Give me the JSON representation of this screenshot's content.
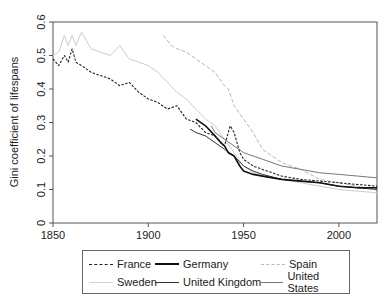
{
  "chart_data": {
    "type": "line",
    "title": "",
    "xlabel": "",
    "ylabel": "Gini coefficient of lifespans",
    "xlim": [
      1850,
      2020
    ],
    "ylim": [
      0,
      0.6
    ],
    "x_ticks": [
      "1850",
      "1900",
      "1950",
      "2000"
    ],
    "y_ticks": [
      "0",
      "0.1",
      "0.2",
      "0.3",
      "0.4",
      "0.5",
      "0.6"
    ],
    "grid": false,
    "legend_position": "bottom",
    "series": [
      {
        "name": "France",
        "style": "dashed",
        "color": "#222222",
        "x": [
          1850,
          1853,
          1856,
          1858,
          1860,
          1862,
          1865,
          1870,
          1875,
          1880,
          1885,
          1890,
          1895,
          1900,
          1905,
          1910,
          1915,
          1920,
          1925,
          1930,
          1935,
          1940,
          1943,
          1945,
          1948,
          1950,
          1955,
          1960,
          1970,
          1980,
          1990,
          2000,
          2010,
          2020
        ],
        "y": [
          0.49,
          0.47,
          0.5,
          0.48,
          0.52,
          0.48,
          0.47,
          0.45,
          0.44,
          0.43,
          0.41,
          0.42,
          0.39,
          0.37,
          0.36,
          0.34,
          0.35,
          0.31,
          0.3,
          0.27,
          0.26,
          0.23,
          0.29,
          0.27,
          0.21,
          0.19,
          0.17,
          0.16,
          0.14,
          0.13,
          0.125,
          0.12,
          0.115,
          0.11
        ]
      },
      {
        "name": "Germany",
        "style": "solid-thick",
        "color": "#111111",
        "x": [
          1925,
          1930,
          1935,
          1938,
          1940,
          1942,
          1945,
          1948,
          1950,
          1955,
          1960,
          1970,
          1980,
          1990,
          2000,
          2010,
          2020
        ],
        "y": [
          0.31,
          0.29,
          0.26,
          0.24,
          0.23,
          0.21,
          0.2,
          0.17,
          0.155,
          0.145,
          0.14,
          0.13,
          0.125,
          0.12,
          0.11,
          0.105,
          0.105
        ]
      },
      {
        "name": "Spain",
        "style": "dashed-light",
        "color": "#aaaaaa",
        "x": [
          1908,
          1912,
          1915,
          1920,
          1925,
          1930,
          1935,
          1940,
          1942,
          1945,
          1950,
          1955,
          1960,
          1965,
          1970,
          1975,
          1980,
          1990,
          2000,
          2010,
          2020
        ],
        "y": [
          0.56,
          0.53,
          0.52,
          0.51,
          0.49,
          0.47,
          0.45,
          0.41,
          0.4,
          0.35,
          0.31,
          0.27,
          0.22,
          0.2,
          0.18,
          0.17,
          0.16,
          0.13,
          0.12,
          0.11,
          0.1
        ]
      },
      {
        "name": "Sweden",
        "style": "solid-light",
        "color": "#c8c8c8",
        "x": [
          1850,
          1853,
          1856,
          1858,
          1860,
          1862,
          1865,
          1870,
          1875,
          1880,
          1885,
          1890,
          1895,
          1900,
          1905,
          1910,
          1915,
          1920,
          1925,
          1930,
          1935,
          1940,
          1945,
          1950,
          1955,
          1960,
          1970,
          1980,
          1990,
          2000,
          2010,
          2020
        ],
        "y": [
          0.5,
          0.51,
          0.56,
          0.53,
          0.56,
          0.53,
          0.57,
          0.52,
          0.51,
          0.5,
          0.53,
          0.49,
          0.48,
          0.47,
          0.45,
          0.42,
          0.39,
          0.37,
          0.34,
          0.31,
          0.29,
          0.25,
          0.21,
          0.17,
          0.15,
          0.14,
          0.13,
          0.12,
          0.11,
          0.1,
          0.095,
          0.09
        ]
      },
      {
        "name": "United Kingdom",
        "style": "solid",
        "color": "#333333",
        "x": [
          1922,
          1925,
          1930,
          1935,
          1940,
          1945,
          1950,
          1955,
          1960,
          1970,
          1980,
          1990,
          2000,
          2010,
          2020
        ],
        "y": [
          0.28,
          0.27,
          0.26,
          0.24,
          0.22,
          0.2,
          0.17,
          0.155,
          0.145,
          0.13,
          0.125,
          0.12,
          0.11,
          0.105,
          0.1
        ]
      },
      {
        "name": "United States",
        "style": "solid-medium",
        "color": "#777777",
        "x": [
          1933,
          1935,
          1940,
          1945,
          1950,
          1955,
          1960,
          1970,
          1980,
          1990,
          2000,
          2010,
          2020
        ],
        "y": [
          0.29,
          0.27,
          0.25,
          0.23,
          0.21,
          0.2,
          0.19,
          0.17,
          0.16,
          0.15,
          0.145,
          0.14,
          0.135
        ]
      }
    ]
  },
  "legend": {
    "items": [
      {
        "label": "France"
      },
      {
        "label": "Germany"
      },
      {
        "label": "Spain"
      },
      {
        "label": "Sweden"
      },
      {
        "label": "United Kingdom"
      },
      {
        "label": "United States"
      }
    ]
  }
}
